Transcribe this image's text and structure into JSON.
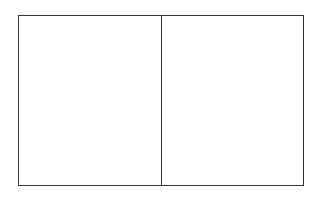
{
  "diagram": {
    "type": "two-panel-rectangle",
    "panels": [
      {
        "id": "left",
        "label": ""
      },
      {
        "id": "right",
        "label": ""
      }
    ],
    "colors": {
      "stroke": "#333333",
      "background": "#ffffff"
    }
  }
}
